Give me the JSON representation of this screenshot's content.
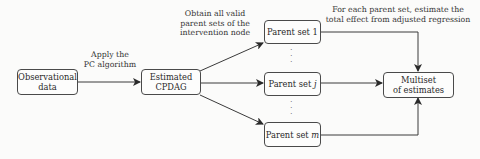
{
  "nodes": {
    "observational": {
      "line1": "Observational",
      "line2": "data"
    },
    "cpdag": {
      "line1": "Estimated",
      "line2": "CPDAG"
    },
    "parent1": {
      "text": "Parent set 1"
    },
    "parentj": {
      "prefix": "Parent set ",
      "var": "j"
    },
    "parentm": {
      "prefix": "Parent set ",
      "var": "m"
    },
    "multiset": {
      "line1": "Multiset",
      "line2": "of estimates"
    }
  },
  "edge_labels": {
    "pc": {
      "line1": "Apply the",
      "line2": "PC algorithm"
    },
    "obtain": {
      "line1": "Obtain all valid",
      "line2": "parent sets of the",
      "line3": "intervention node"
    },
    "estimate": {
      "line1": "For each parent set, estimate the",
      "line2": "total effect from adjusted regression"
    }
  },
  "colors": {
    "stroke": "#3a3a3a",
    "background": "#fbfbfa"
  }
}
